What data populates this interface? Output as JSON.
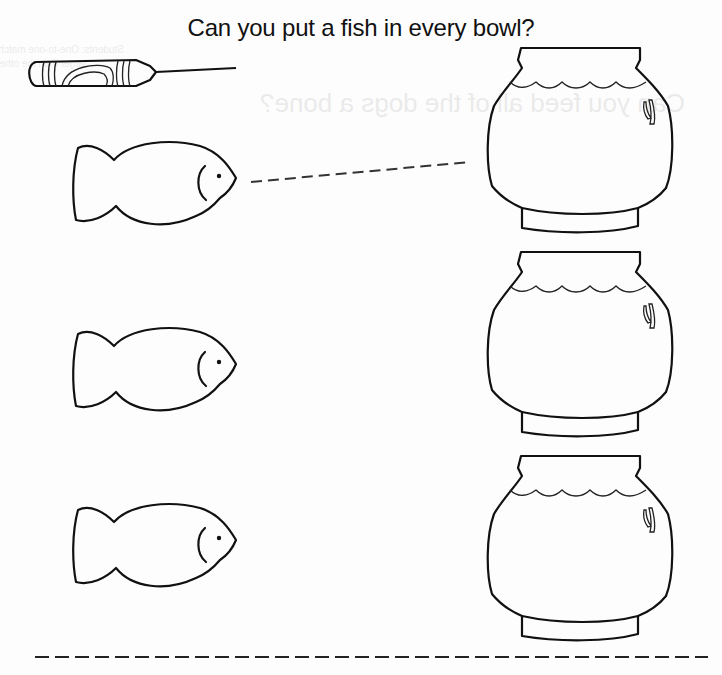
{
  "worksheet": {
    "title": "Can you put a fish in every bowl?",
    "instruction_type": "trace-the-dashed-line",
    "fish_count": 3,
    "bowl_count": 3,
    "ink_color": "#111111",
    "background_color": "#fdfdfd"
  },
  "bleed_through": {
    "reverse_heading": "Can you feed all of the dogs a bone?",
    "reverse_note_line1": "Students: One-to-one match...",
    "reverse_note_line2": "larger than the other."
  },
  "elements": {
    "crayon": "crayon-icon",
    "fish": [
      "fish-1",
      "fish-2",
      "fish-3"
    ],
    "bowls": [
      "fishbowl-1",
      "fishbowl-2",
      "fishbowl-3"
    ],
    "guide_line": "dashed-trace-line",
    "cut_line": "dashed-cut-line"
  }
}
